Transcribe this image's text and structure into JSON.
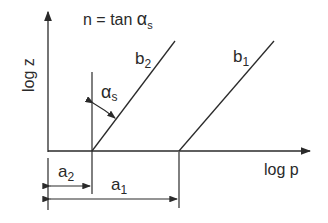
{
  "diagram": {
    "formula": {
      "lhs": "n = tan ",
      "alpha": "α",
      "sub": "s"
    },
    "y_axis_label": "log z",
    "x_axis_label": "log p",
    "lines": [
      {
        "id": "b2",
        "base": "b",
        "sub": "2"
      },
      {
        "id": "b1",
        "base": "b",
        "sub": "1"
      }
    ],
    "angle_label": {
      "alpha": "α",
      "sub": "s"
    },
    "dimensions": [
      {
        "id": "a2",
        "base": "a",
        "sub": "2"
      },
      {
        "id": "a1",
        "base": "a",
        "sub": "1"
      }
    ],
    "stroke_color": "#2a2a2a"
  }
}
